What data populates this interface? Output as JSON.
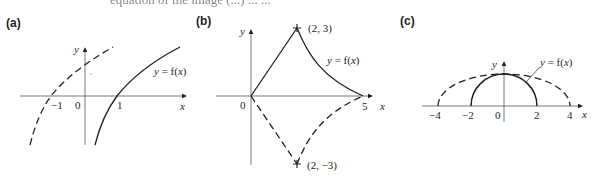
{
  "header": {
    "clipped_text": "equation of the image (...) ... ..."
  },
  "panels": [
    {
      "label": "(a)",
      "axis_x": "x",
      "axis_y": "y",
      "ticks": [
        "−1",
        "0",
        "1"
      ],
      "curve_label": "y = f(x)"
    },
    {
      "label": "(b)",
      "axis_x": "x",
      "axis_y": "y",
      "ticks": [
        "0",
        "5"
      ],
      "point_top": "(2, 3)",
      "point_bottom": "(2, −3)",
      "curve_label": "y = f(x)"
    },
    {
      "label": "(c)",
      "axis_x": "x",
      "axis_y": "y",
      "ticks": [
        "−4",
        "−2",
        "0",
        "2",
        "4"
      ],
      "curve_label": "y = f(x)"
    }
  ],
  "colors": {
    "ink": "#231f20",
    "axis": "#555555"
  }
}
